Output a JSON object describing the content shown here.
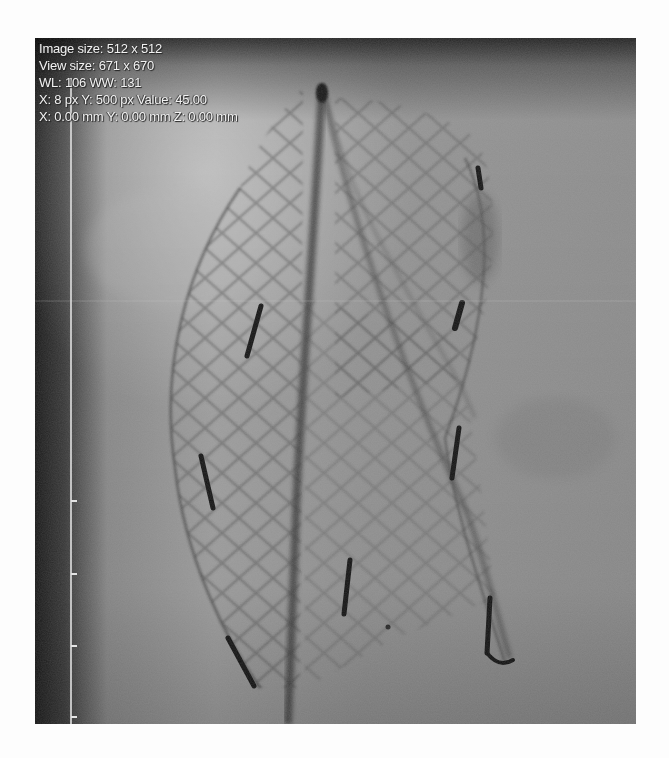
{
  "viewer": {
    "overlay": {
      "image_size": "Image size: 512 x 512",
      "view_size": "View size: 671 x 670",
      "window_level": "WL: 106 WW: 131",
      "pixel_info": "X: 8 px Y: 500 px Value: 45.00",
      "mm_info": "X: 0.00 mm Y: 0.00 mm Z: 0.00 mm"
    },
    "image": {
      "modality": "X-ray fluoroscopy",
      "subject": "stent graft with radiopaque markers",
      "background_color": "#8a8a8a"
    },
    "ruler": {
      "ticks_y": [
        462,
        535,
        607,
        678
      ]
    }
  }
}
